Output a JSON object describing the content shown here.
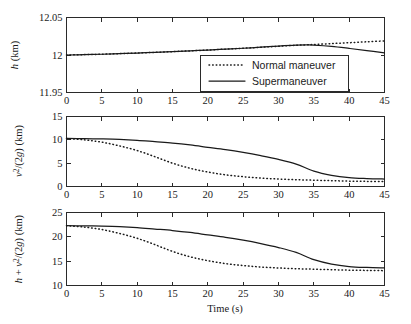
{
  "figure": {
    "background": "#ffffff",
    "foreground": "#1a1a1a",
    "xlabel": "Time (s)"
  },
  "legend": {
    "position": "top-panel-lower-right",
    "entries": [
      {
        "label": "Normal maneuver",
        "style": "dotted"
      },
      {
        "label": "Supermaneuver",
        "style": "solid"
      }
    ]
  },
  "chart_data": [
    {
      "type": "line",
      "panel": "top",
      "title": "",
      "xlabel": "",
      "ylabel": "h (km)",
      "xlim": [
        0,
        45
      ],
      "ylim": [
        11.95,
        12.05
      ],
      "xticks": [
        0,
        5,
        10,
        15,
        20,
        25,
        30,
        35,
        40,
        45
      ],
      "xticklabels": [
        "0",
        "5",
        "10",
        "15",
        "20",
        "25",
        "30",
        "35",
        "40",
        "45"
      ],
      "yticks": [
        11.95,
        12,
        12.05
      ],
      "yticklabels": [
        "11.95",
        "12",
        "12.05"
      ],
      "grid": false,
      "x": [
        0,
        2.5,
        5,
        7.5,
        10,
        12.5,
        15,
        17.5,
        20,
        22.5,
        25,
        27.5,
        30,
        32.5,
        34,
        35,
        37.5,
        40,
        42.5,
        45
      ],
      "series": [
        {
          "name": "Normal maneuver",
          "style": "dotted",
          "values": [
            12.0,
            12.0005,
            12.001,
            12.0018,
            12.0026,
            12.0035,
            12.0045,
            12.0055,
            12.0066,
            12.0078,
            12.009,
            12.0103,
            12.0117,
            12.013,
            12.0136,
            12.014,
            12.0152,
            12.0164,
            12.0176,
            12.0188
          ]
        },
        {
          "name": "Supermaneuver",
          "style": "solid",
          "values": [
            12.0,
            12.0005,
            12.001,
            12.0018,
            12.0026,
            12.0035,
            12.0045,
            12.0055,
            12.0066,
            12.0078,
            12.009,
            12.0104,
            12.0119,
            12.0131,
            12.0134,
            12.0132,
            12.0115,
            12.0088,
            12.0058,
            12.0028
          ]
        }
      ]
    },
    {
      "type": "line",
      "panel": "middle",
      "title": "",
      "xlabel": "",
      "ylabel": "v^2/(2g) (km)",
      "xlim": [
        0,
        45
      ],
      "ylim": [
        0,
        15
      ],
      "xticks": [
        0,
        5,
        10,
        15,
        20,
        25,
        30,
        35,
        40,
        45
      ],
      "xticklabels": [
        "0",
        "5",
        "10",
        "15",
        "20",
        "25",
        "30",
        "35",
        "40",
        "45"
      ],
      "yticks": [
        0,
        5,
        10,
        15
      ],
      "yticklabels": [
        "0",
        "5",
        "10",
        "15"
      ],
      "grid": false,
      "x": [
        0,
        2.5,
        5,
        7.5,
        10,
        12.5,
        15,
        17.5,
        20,
        22.5,
        25,
        27.5,
        30,
        32.5,
        35,
        37.5,
        40,
        42.5,
        45
      ],
      "series": [
        {
          "name": "Normal maneuver",
          "style": "dotted",
          "values": [
            10.3,
            10.0,
            9.5,
            8.7,
            7.7,
            6.4,
            5.0,
            3.9,
            3.1,
            2.5,
            2.1,
            1.8,
            1.6,
            1.45,
            1.35,
            1.25,
            1.15,
            1.1,
            1.05
          ]
        },
        {
          "name": "Supermaneuver",
          "style": "solid",
          "values": [
            10.3,
            10.25,
            10.2,
            10.1,
            9.9,
            9.6,
            9.3,
            8.9,
            8.4,
            7.9,
            7.3,
            6.6,
            5.8,
            4.8,
            3.3,
            2.4,
            1.9,
            1.7,
            1.6
          ]
        }
      ]
    },
    {
      "type": "line",
      "panel": "bottom",
      "title": "",
      "xlabel": "Time (s)",
      "ylabel": "h + v^2/(2g) (km)",
      "xlim": [
        0,
        45
      ],
      "ylim": [
        10,
        25
      ],
      "xticks": [
        0,
        5,
        10,
        15,
        20,
        25,
        30,
        35,
        40,
        45
      ],
      "xticklabels": [
        "0",
        "5",
        "10",
        "15",
        "20",
        "25",
        "30",
        "35",
        "40",
        "45"
      ],
      "yticks": [
        10,
        15,
        20,
        25
      ],
      "yticklabels": [
        "10",
        "15",
        "20",
        "25"
      ],
      "grid": false,
      "x": [
        0,
        2.5,
        5,
        7.5,
        10,
        12.5,
        15,
        17.5,
        20,
        22.5,
        25,
        27.5,
        30,
        32.5,
        35,
        37.5,
        40,
        42.5,
        45
      ],
      "series": [
        {
          "name": "Normal maneuver",
          "style": "dotted",
          "values": [
            22.3,
            22.0,
            21.5,
            20.7,
            19.7,
            18.4,
            17.0,
            15.9,
            15.1,
            14.5,
            14.1,
            13.8,
            13.6,
            13.45,
            13.35,
            13.25,
            13.15,
            13.1,
            13.05
          ]
        },
        {
          "name": "Supermaneuver",
          "style": "solid",
          "values": [
            22.3,
            22.25,
            22.2,
            22.1,
            21.9,
            21.6,
            21.3,
            20.9,
            20.4,
            19.9,
            19.3,
            18.6,
            17.8,
            16.8,
            15.3,
            14.4,
            13.9,
            13.7,
            13.6
          ]
        }
      ]
    }
  ]
}
